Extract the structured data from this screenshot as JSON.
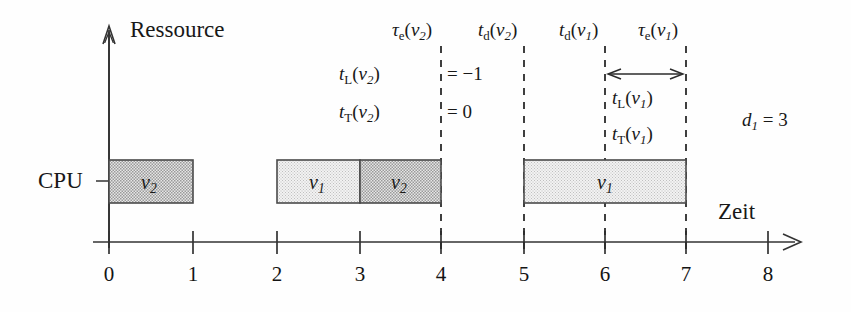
{
  "figure": {
    "title_hidden": "Gantt-Diagramm Ablaufplanung CPU",
    "axes": {
      "y_label": "Ressource",
      "x_label": "Zeit",
      "resource_row_label": "CPU",
      "x_ticks": [
        "0",
        "1",
        "2",
        "3",
        "4",
        "5",
        "6",
        "7",
        "8"
      ]
    },
    "tasks": [
      {
        "name": "v2-block-1",
        "label_base": "v",
        "label_sub": "2",
        "start": 0,
        "end": 1,
        "shade": "dark"
      },
      {
        "name": "v1-block-1",
        "label_base": "v",
        "label_sub": "1",
        "start": 2,
        "end": 3,
        "shade": "light"
      },
      {
        "name": "v2-block-2",
        "label_base": "v",
        "label_sub": "2",
        "start": 3,
        "end": 4,
        "shade": "dark"
      },
      {
        "name": "v1-block-2",
        "label_base": "v",
        "label_sub": "1",
        "start": 5,
        "end": 7,
        "shade": "light"
      }
    ],
    "markers": [
      {
        "name": "tau-e-v2",
        "symbol": "τ",
        "symbol_sub": "e",
        "arg_base": "v",
        "arg_sub": "2",
        "time": 4
      },
      {
        "name": "t-d-v2",
        "symbol": "t",
        "symbol_sub": "d",
        "arg_base": "v",
        "arg_sub": "2",
        "time": 5
      },
      {
        "name": "t-d-v1",
        "symbol": "t",
        "symbol_sub": "d",
        "arg_base": "v",
        "arg_sub": "1",
        "time": 6
      },
      {
        "name": "tau-e-v1",
        "symbol": "τ",
        "symbol_sub": "e",
        "arg_base": "v",
        "arg_sub": "1",
        "time": 7
      }
    ],
    "annotations": {
      "tl_v2": {
        "symbol": "t",
        "symbol_sub": "L",
        "arg_base": "v",
        "arg_sub": "2",
        "equals": "=",
        "value": "−1"
      },
      "tt_v2": {
        "symbol": "t",
        "symbol_sub": "T",
        "arg_base": "v",
        "arg_sub": "2",
        "equals": "=",
        "value": "0"
      },
      "tl_v1": {
        "symbol": "t",
        "symbol_sub": "L",
        "arg_base": "v",
        "arg_sub": "1"
      },
      "tt_v1": {
        "symbol": "t",
        "symbol_sub": "T",
        "arg_base": "v",
        "arg_sub": "1"
      },
      "deadline": {
        "symbol": "d",
        "symbol_sub": "1",
        "equals": "=",
        "value": "3"
      }
    },
    "colors": {
      "stroke": "#333333",
      "dashed": "#2b2b2b",
      "fill_dark": "#cfcfcf",
      "fill_light": "#ebebeb",
      "text": "#181818"
    }
  }
}
